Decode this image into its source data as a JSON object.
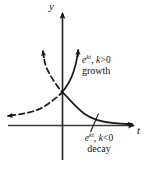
{
  "figure": {
    "name": "exponential-growth-decay-diagram",
    "width": 154,
    "height": 170,
    "background_color": "#ffffff",
    "ink_color": "#1a1a1a"
  },
  "axes": {
    "vertical": {
      "label": "y",
      "icon": "axis-arrow-up-icon",
      "x": 62,
      "top": 10,
      "bottom": 160
    },
    "horizontal": {
      "label": "t",
      "icon": "axis-arrow-right-icon",
      "y": 125,
      "left": 8,
      "right": 137
    },
    "origin": {
      "x": 62,
      "y": 125
    }
  },
  "curves": [
    {
      "id": "growth",
      "style": "solid",
      "math_base": "e",
      "math_exponent": "kt",
      "math_separator": ", ",
      "math_variable": "k",
      "math_relation": ">",
      "math_value": "0",
      "math_full": "e kt, k > 0",
      "word": "growth",
      "arrow": "curve-arrow-up-right-icon"
    },
    {
      "id": "decay",
      "style": "solid",
      "math_base": "e",
      "math_exponent": "kt",
      "math_separator": ", ",
      "math_variable": "k",
      "math_relation": "<",
      "math_value": "0",
      "math_full": "e kt, k < 0",
      "word": "decay",
      "arrow": "curve-arrow-right-icon",
      "leader_line": true
    },
    {
      "id": "decay-mirror-dashed",
      "style": "dashed",
      "arrow_left": "curve-arrow-left-icon",
      "arrow_up": "curve-arrow-up-left-icon"
    }
  ]
}
